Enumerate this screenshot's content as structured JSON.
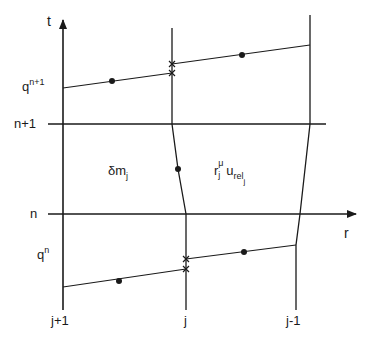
{
  "diagram": {
    "axes": {
      "vertical_label": "t",
      "horizontal_label": "r"
    },
    "time_levels": {
      "upper": "n+1",
      "lower": "n"
    },
    "flux_labels": {
      "upper_base": "q",
      "upper_sup": "n+1",
      "lower_base": "q",
      "lower_sup": "n"
    },
    "cell_labels": {
      "mass_symbol": "δm",
      "mass_sub": "j",
      "flux_r": "r",
      "flux_r_sub": "j",
      "flux_r_sup": "μ",
      "flux_u": "u",
      "flux_u_sub": "rel",
      "flux_u_subsub": "j"
    },
    "grid_labels": {
      "left": "j+1",
      "middle": "j",
      "right": "j-1"
    },
    "colors": {
      "line": "#1a1a1a",
      "background": "#ffffff"
    }
  }
}
